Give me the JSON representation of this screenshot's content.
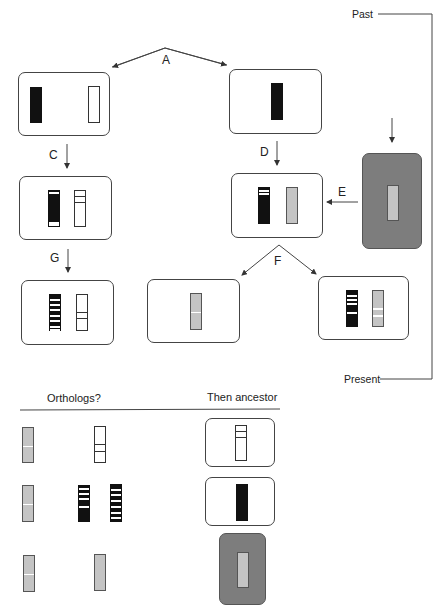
{
  "timeline": {
    "past_label": "Past",
    "present_label": "Present"
  },
  "step_labels": {
    "A": "A",
    "B": "B",
    "C": "C",
    "D": "D",
    "E": "E",
    "F": "F",
    "G": "G"
  },
  "table": {
    "header_left": "Orthologs?",
    "header_right": "Then ancestor"
  },
  "colors": {
    "black_gene": "#111111",
    "grey_gene": "#c4c4c4",
    "dark_box": "#7d7d7d",
    "line": "#444444"
  }
}
